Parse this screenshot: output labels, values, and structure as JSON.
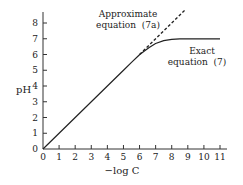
{
  "chart_data": {
    "type": "line",
    "title": "",
    "xlabel": "−log C",
    "ylabel": "pH",
    "xlim": [
      0,
      11
    ],
    "ylim": [
      0,
      8
    ],
    "x_ticks": [
      0,
      1,
      2,
      3,
      4,
      5,
      6,
      7,
      8,
      9,
      10,
      11
    ],
    "x_tick_labels": [
      "0",
      "1",
      "2",
      "3",
      "4",
      "5",
      "6",
      "7",
      "8",
      "9",
      "10",
      "11"
    ],
    "y_ticks": [
      0,
      1,
      2,
      3,
      4,
      5,
      6,
      7,
      8
    ],
    "y_tick_labels": [
      "0",
      "1",
      "2",
      "3",
      "4",
      "5",
      "6",
      "7",
      "8"
    ],
    "grid": false,
    "series": [
      {
        "name": "Exact equation (7)",
        "style": "solid",
        "x": [
          0,
          1,
          2,
          3,
          4,
          5,
          5.5,
          6,
          6.3,
          6.6,
          7,
          7.5,
          8,
          8.5,
          9,
          10,
          11
        ],
        "y": [
          0,
          1,
          2,
          3,
          4,
          5,
          5.5,
          5.98,
          6.22,
          6.45,
          6.7,
          6.88,
          6.96,
          6.99,
          7.0,
          7.0,
          7.0
        ]
      },
      {
        "name": "Approximate equation (7a)",
        "style": "dashed",
        "x": [
          6,
          8.8
        ],
        "y": [
          6,
          8.8
        ]
      }
    ],
    "annotations": [
      {
        "id": "approx",
        "lines": [
          "Approximate",
          "equation  (7a)"
        ]
      },
      {
        "id": "exact",
        "lines": [
          "Exact",
          "equation  (7)"
        ]
      }
    ]
  }
}
